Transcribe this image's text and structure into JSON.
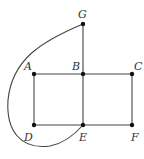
{
  "diagram": {
    "type": "graph",
    "colors": {
      "edge": "#444444",
      "node": "#111111",
      "label": "#333333",
      "background": "#ffffff"
    },
    "nodes": [
      {
        "id": "G",
        "label": "G",
        "x": 83,
        "y": 24,
        "lx": 78,
        "ly": 18
      },
      {
        "id": "A",
        "label": "A",
        "x": 34,
        "y": 74,
        "lx": 24,
        "ly": 70
      },
      {
        "id": "B",
        "label": "B",
        "x": 83,
        "y": 74,
        "lx": 72,
        "ly": 70
      },
      {
        "id": "C",
        "label": "C",
        "x": 132,
        "y": 74,
        "lx": 134,
        "ly": 70
      },
      {
        "id": "D",
        "label": "D",
        "x": 34,
        "y": 125,
        "lx": 24,
        "ly": 141
      },
      {
        "id": "E",
        "label": "E",
        "x": 83,
        "y": 125,
        "lx": 79,
        "ly": 141
      },
      {
        "id": "F",
        "label": "F",
        "x": 132,
        "y": 125,
        "lx": 131,
        "ly": 141
      }
    ],
    "edges": [
      {
        "from": "G",
        "to": "B",
        "shape": "straight"
      },
      {
        "from": "A",
        "to": "B",
        "shape": "straight"
      },
      {
        "from": "B",
        "to": "C",
        "shape": "straight"
      },
      {
        "from": "A",
        "to": "D",
        "shape": "straight"
      },
      {
        "from": "B",
        "to": "E",
        "shape": "straight"
      },
      {
        "from": "C",
        "to": "F",
        "shape": "straight"
      },
      {
        "from": "D",
        "to": "E",
        "shape": "straight"
      },
      {
        "from": "E",
        "to": "F",
        "shape": "straight"
      },
      {
        "from": "G",
        "to": "E",
        "shape": "curve",
        "path": "M83,24 C40,42 12,60 8,100 C6,130 20,150 50,146 C66,143 76,133 83,125"
      }
    ]
  }
}
